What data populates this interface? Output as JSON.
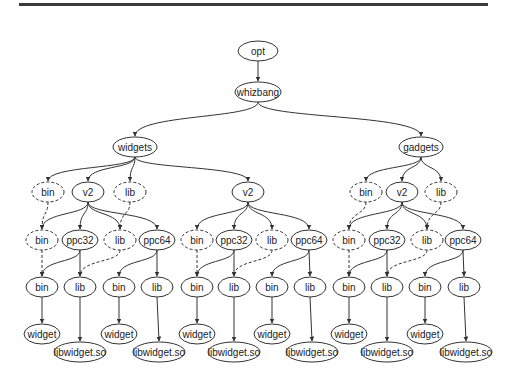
{
  "figure": {
    "type": "directory-tree",
    "nodes": [
      {
        "id": "opt",
        "label": "opt",
        "x": 258,
        "y": 51,
        "rx": 20,
        "style": "solid"
      },
      {
        "id": "whizbang",
        "label": "whizbang",
        "x": 258,
        "y": 92,
        "rx": 23,
        "style": "solid"
      },
      {
        "id": "widgets",
        "label": "widgets",
        "x": 135,
        "y": 147,
        "rx": 22,
        "style": "solid"
      },
      {
        "id": "gadgets",
        "label": "gadgets",
        "x": 421,
        "y": 147,
        "rx": 22,
        "style": "solid"
      },
      {
        "id": "w_bin",
        "label": "bin",
        "x": 48,
        "y": 192,
        "rx": 16,
        "style": "dashed"
      },
      {
        "id": "w_v2",
        "label": "v2",
        "x": 88,
        "y": 192,
        "rx": 16,
        "style": "solid"
      },
      {
        "id": "w_lib",
        "label": "lib",
        "x": 130,
        "y": 192,
        "rx": 16,
        "style": "dashed"
      },
      {
        "id": "w_bin2",
        "label": "bin",
        "x": 42,
        "y": 240,
        "rx": 16,
        "style": "dashed"
      },
      {
        "id": "w_ppc32",
        "label": "ppc32",
        "x": 80,
        "y": 240,
        "rx": 18,
        "style": "solid"
      },
      {
        "id": "w_lib2",
        "label": "lib",
        "x": 120,
        "y": 240,
        "rx": 16,
        "style": "dashed"
      },
      {
        "id": "w_ppc64",
        "label": "ppc64",
        "x": 157,
        "y": 240,
        "rx": 18,
        "style": "solid"
      },
      {
        "id": "w_32bin",
        "label": "bin",
        "x": 42,
        "y": 287,
        "rx": 16,
        "style": "solid"
      },
      {
        "id": "w_32lib",
        "label": "lib",
        "x": 80,
        "y": 287,
        "rx": 16,
        "style": "solid"
      },
      {
        "id": "w_64bin",
        "label": "bin",
        "x": 119,
        "y": 287,
        "rx": 16,
        "style": "solid"
      },
      {
        "id": "w_64lib",
        "label": "lib",
        "x": 157,
        "y": 287,
        "rx": 16,
        "style": "solid"
      },
      {
        "id": "w_32widget",
        "label": "widget",
        "x": 42,
        "y": 334,
        "rx": 18,
        "style": "solid"
      },
      {
        "id": "w_32so",
        "label": "libwidget.so",
        "x": 80,
        "y": 352,
        "rx": 26,
        "style": "solid"
      },
      {
        "id": "w_64widget",
        "label": "widget",
        "x": 119,
        "y": 334,
        "rx": 18,
        "style": "solid"
      },
      {
        "id": "w_64so",
        "label": "libwidget.so",
        "x": 159,
        "y": 352,
        "rx": 26,
        "style": "solid"
      },
      {
        "id": "m_v2",
        "label": "v2",
        "x": 248,
        "y": 192,
        "rx": 16,
        "style": "solid"
      },
      {
        "id": "m_bin",
        "label": "bin",
        "x": 197,
        "y": 240,
        "rx": 16,
        "style": "dashed"
      },
      {
        "id": "m_ppc32",
        "label": "ppc32",
        "x": 234,
        "y": 240,
        "rx": 18,
        "style": "solid"
      },
      {
        "id": "m_lib",
        "label": "lib",
        "x": 272,
        "y": 240,
        "rx": 16,
        "style": "dashed"
      },
      {
        "id": "m_ppc64",
        "label": "ppc64",
        "x": 309,
        "y": 240,
        "rx": 18,
        "style": "solid"
      },
      {
        "id": "m_32bin",
        "label": "bin",
        "x": 197,
        "y": 287,
        "rx": 16,
        "style": "solid"
      },
      {
        "id": "m_32lib",
        "label": "lib",
        "x": 234,
        "y": 287,
        "rx": 16,
        "style": "solid"
      },
      {
        "id": "m_64bin",
        "label": "bin",
        "x": 272,
        "y": 287,
        "rx": 16,
        "style": "solid"
      },
      {
        "id": "m_64lib",
        "label": "lib",
        "x": 310,
        "y": 287,
        "rx": 16,
        "style": "solid"
      },
      {
        "id": "m_32widget",
        "label": "widget",
        "x": 197,
        "y": 334,
        "rx": 18,
        "style": "solid"
      },
      {
        "id": "m_32so",
        "label": "libwidget.so",
        "x": 234,
        "y": 352,
        "rx": 26,
        "style": "solid"
      },
      {
        "id": "m_64widget",
        "label": "widget",
        "x": 272,
        "y": 334,
        "rx": 18,
        "style": "solid"
      },
      {
        "id": "m_64so",
        "label": "libwidget.so",
        "x": 312,
        "y": 352,
        "rx": 26,
        "style": "solid"
      },
      {
        "id": "g_bin",
        "label": "bin",
        "x": 366,
        "y": 192,
        "rx": 16,
        "style": "dashed"
      },
      {
        "id": "g_v2",
        "label": "v2",
        "x": 402,
        "y": 192,
        "rx": 16,
        "style": "solid"
      },
      {
        "id": "g_lib",
        "label": "lib",
        "x": 441,
        "y": 192,
        "rx": 16,
        "style": "dashed"
      },
      {
        "id": "g_bin2",
        "label": "bin",
        "x": 349,
        "y": 240,
        "rx": 16,
        "style": "dashed"
      },
      {
        "id": "g_ppc32",
        "label": "ppc32",
        "x": 387,
        "y": 240,
        "rx": 18,
        "style": "solid"
      },
      {
        "id": "g_lib2",
        "label": "lib",
        "x": 427,
        "y": 240,
        "rx": 16,
        "style": "dashed"
      },
      {
        "id": "g_ppc64",
        "label": "ppc64",
        "x": 463,
        "y": 240,
        "rx": 18,
        "style": "solid"
      },
      {
        "id": "g_32bin",
        "label": "bin",
        "x": 349,
        "y": 287,
        "rx": 16,
        "style": "solid"
      },
      {
        "id": "g_32lib",
        "label": "lib",
        "x": 387,
        "y": 287,
        "rx": 16,
        "style": "solid"
      },
      {
        "id": "g_64bin",
        "label": "bin",
        "x": 425,
        "y": 287,
        "rx": 16,
        "style": "solid"
      },
      {
        "id": "g_64lib",
        "label": "lib",
        "x": 464,
        "y": 287,
        "rx": 16,
        "style": "solid"
      },
      {
        "id": "g_32widget",
        "label": "widget",
        "x": 349,
        "y": 334,
        "rx": 18,
        "style": "solid"
      },
      {
        "id": "g_32so",
        "label": "libwidget.so",
        "x": 387,
        "y": 352,
        "rx": 26,
        "style": "solid"
      },
      {
        "id": "g_64widget",
        "label": "widget",
        "x": 425,
        "y": 334,
        "rx": 18,
        "style": "solid"
      },
      {
        "id": "g_64so",
        "label": "libwidget.so",
        "x": 466,
        "y": 352,
        "rx": 26,
        "style": "solid"
      }
    ],
    "edges": [
      {
        "from": "opt",
        "to": "whizbang",
        "style": "solid"
      },
      {
        "from": "whizbang",
        "to": "widgets",
        "style": "solid"
      },
      {
        "from": "whizbang",
        "to": "gadgets",
        "style": "solid"
      },
      {
        "from": "widgets",
        "to": "w_bin",
        "style": "solid"
      },
      {
        "from": "widgets",
        "to": "w_v2",
        "style": "solid"
      },
      {
        "from": "widgets",
        "to": "w_lib",
        "style": "solid"
      },
      {
        "from": "widgets",
        "to": "m_v2",
        "style": "solid"
      },
      {
        "from": "w_bin",
        "to": "w_bin2",
        "style": "dashed"
      },
      {
        "from": "w_lib",
        "to": "w_lib2",
        "style": "dashed"
      },
      {
        "from": "w_v2",
        "to": "w_bin2",
        "style": "solid"
      },
      {
        "from": "w_v2",
        "to": "w_ppc32",
        "style": "solid"
      },
      {
        "from": "w_v2",
        "to": "w_lib2",
        "style": "solid"
      },
      {
        "from": "w_v2",
        "to": "w_ppc64",
        "style": "solid"
      },
      {
        "from": "w_bin2",
        "to": "w_32bin",
        "style": "dashed"
      },
      {
        "from": "w_ppc32",
        "to": "w_32bin",
        "style": "solid"
      },
      {
        "from": "w_ppc32",
        "to": "w_32lib",
        "style": "solid"
      },
      {
        "from": "w_lib2",
        "to": "w_32lib",
        "style": "dashed"
      },
      {
        "from": "w_ppc64",
        "to": "w_64bin",
        "style": "solid"
      },
      {
        "from": "w_ppc64",
        "to": "w_64lib",
        "style": "solid"
      },
      {
        "from": "w_32bin",
        "to": "w_32widget",
        "style": "solid"
      },
      {
        "from": "w_32lib",
        "to": "w_32so",
        "style": "solid"
      },
      {
        "from": "w_64bin",
        "to": "w_64widget",
        "style": "solid"
      },
      {
        "from": "w_64lib",
        "to": "w_64so",
        "style": "solid"
      },
      {
        "from": "m_v2",
        "to": "m_bin",
        "style": "solid"
      },
      {
        "from": "m_v2",
        "to": "m_ppc32",
        "style": "solid"
      },
      {
        "from": "m_v2",
        "to": "m_lib",
        "style": "solid"
      },
      {
        "from": "m_v2",
        "to": "m_ppc64",
        "style": "solid"
      },
      {
        "from": "m_bin",
        "to": "m_32bin",
        "style": "dashed"
      },
      {
        "from": "m_ppc32",
        "to": "m_32bin",
        "style": "solid"
      },
      {
        "from": "m_ppc32",
        "to": "m_32lib",
        "style": "solid"
      },
      {
        "from": "m_lib",
        "to": "m_32lib",
        "style": "dashed"
      },
      {
        "from": "m_ppc64",
        "to": "m_64bin",
        "style": "solid"
      },
      {
        "from": "m_ppc64",
        "to": "m_64lib",
        "style": "solid"
      },
      {
        "from": "m_32bin",
        "to": "m_32widget",
        "style": "solid"
      },
      {
        "from": "m_32lib",
        "to": "m_32so",
        "style": "solid"
      },
      {
        "from": "m_64bin",
        "to": "m_64widget",
        "style": "solid"
      },
      {
        "from": "m_64lib",
        "to": "m_64so",
        "style": "solid"
      },
      {
        "from": "gadgets",
        "to": "g_bin",
        "style": "solid"
      },
      {
        "from": "gadgets",
        "to": "g_v2",
        "style": "solid"
      },
      {
        "from": "gadgets",
        "to": "g_lib",
        "style": "solid"
      },
      {
        "from": "g_bin",
        "to": "g_bin2",
        "style": "dashed"
      },
      {
        "from": "g_lib",
        "to": "g_lib2",
        "style": "dashed"
      },
      {
        "from": "g_v2",
        "to": "g_bin2",
        "style": "solid"
      },
      {
        "from": "g_v2",
        "to": "g_ppc32",
        "style": "solid"
      },
      {
        "from": "g_v2",
        "to": "g_lib2",
        "style": "solid"
      },
      {
        "from": "g_v2",
        "to": "g_ppc64",
        "style": "solid"
      },
      {
        "from": "g_bin2",
        "to": "g_32bin",
        "style": "dashed"
      },
      {
        "from": "g_ppc32",
        "to": "g_32bin",
        "style": "solid"
      },
      {
        "from": "g_ppc32",
        "to": "g_32lib",
        "style": "solid"
      },
      {
        "from": "g_lib2",
        "to": "g_32lib",
        "style": "dashed"
      },
      {
        "from": "g_ppc64",
        "to": "g_64bin",
        "style": "solid"
      },
      {
        "from": "g_ppc64",
        "to": "g_64lib",
        "style": "solid"
      },
      {
        "from": "g_32bin",
        "to": "g_32widget",
        "style": "solid"
      },
      {
        "from": "g_32lib",
        "to": "g_32so",
        "style": "solid"
      },
      {
        "from": "g_64bin",
        "to": "g_64widget",
        "style": "solid"
      },
      {
        "from": "g_64lib",
        "to": "g_64so",
        "style": "solid"
      }
    ]
  },
  "colors": {
    "stroke": "#333333",
    "text": "#222222",
    "background": "#ffffff",
    "rule": "#3a3a3a"
  }
}
